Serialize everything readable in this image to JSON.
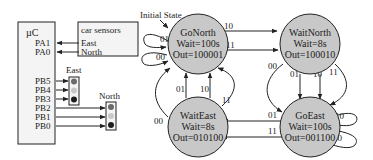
{
  "microcontroller": {
    "label": "µC",
    "pins_in": [
      "PA1",
      "PA0"
    ],
    "pins_out": [
      "PB5",
      "PB4",
      "PB3",
      "PB2",
      "PB1",
      "PB0"
    ]
  },
  "sensors": {
    "title": "car sensors",
    "east": "East",
    "north": "North"
  },
  "lights": {
    "east_label": "East",
    "north_label": "North",
    "colors": {
      "red": "#6a6a6a",
      "yellow": "#c8c8c8",
      "green": "#1e1e1e"
    }
  },
  "fsm": {
    "initial_label": "Initial State",
    "states": [
      {
        "id": "GoNorth",
        "name": "GoNorth",
        "wait": "Wait=100s",
        "out": "Out=100001"
      },
      {
        "id": "WaitNorth",
        "name": "WaitNorth",
        "wait": "Wait=8s",
        "out": "Out=100010"
      },
      {
        "id": "WaitEast",
        "name": "WaitEast",
        "wait": "Wait=8s",
        "out": "Out=010100"
      },
      {
        "id": "GoEast",
        "name": "GoEast",
        "wait": "Wait=100s",
        "out": "Out=001100"
      }
    ],
    "transitions": [
      {
        "from": "GoNorth",
        "to": "GoNorth",
        "label": "01"
      },
      {
        "from": "GoNorth",
        "to": "GoNorth",
        "label": "00"
      },
      {
        "from": "GoNorth",
        "to": "WaitNorth",
        "label": "10"
      },
      {
        "from": "GoNorth",
        "to": "WaitNorth",
        "label": "11"
      },
      {
        "from": "WaitNorth",
        "to": "GoEast",
        "label": "00"
      },
      {
        "from": "WaitNorth",
        "to": "GoEast",
        "label": "01"
      },
      {
        "from": "WaitNorth",
        "to": "GoEast",
        "label": "10"
      },
      {
        "from": "WaitNorth",
        "to": "GoEast",
        "label": "11"
      },
      {
        "from": "GoEast",
        "to": "GoEast",
        "label": "10"
      },
      {
        "from": "GoEast",
        "to": "GoEast",
        "label": "00"
      },
      {
        "from": "GoEast",
        "to": "WaitEast",
        "label": "01"
      },
      {
        "from": "GoEast",
        "to": "WaitEast",
        "label": "11"
      },
      {
        "from": "WaitEast",
        "to": "GoNorth",
        "label": "00"
      },
      {
        "from": "WaitEast",
        "to": "GoNorth",
        "label": "01"
      },
      {
        "from": "WaitEast",
        "to": "GoNorth",
        "label": "10"
      },
      {
        "from": "WaitEast",
        "to": "GoNorth",
        "label": "11"
      }
    ]
  }
}
